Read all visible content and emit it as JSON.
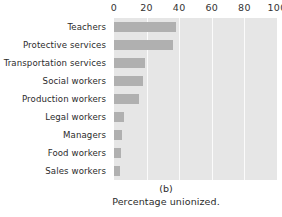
{
  "chart_data": {
    "type": "bar",
    "orientation": "horizontal",
    "title": "",
    "subtitle": "",
    "panel_letter": "(b)",
    "caption": "Percentage unionized.",
    "xlabel": "",
    "ylabel": "",
    "categories": [
      "Teachers",
      "Protective services",
      "Transportation services",
      "Social workers",
      "Production workers",
      "Legal workers",
      "Managers",
      "Food workers",
      "Sales workers"
    ],
    "values": [
      38,
      36,
      19,
      18,
      15.5,
      6,
      5,
      4.5,
      3.5
    ],
    "xlim": [
      0,
      100
    ],
    "xticks": [
      0,
      20,
      40,
      60,
      80,
      100
    ],
    "xtick_labels": [
      "0",
      "20",
      "40",
      "60",
      "80",
      "100"
    ],
    "grid": true,
    "grid_axis": "x",
    "legend": "none",
    "colors": {
      "bar": "#b0b0b0",
      "plot_background": "#e6e6e6",
      "gridline": "#fbfbfb",
      "figure_background": "#ffffff",
      "text": "#2b2b2b"
    }
  }
}
